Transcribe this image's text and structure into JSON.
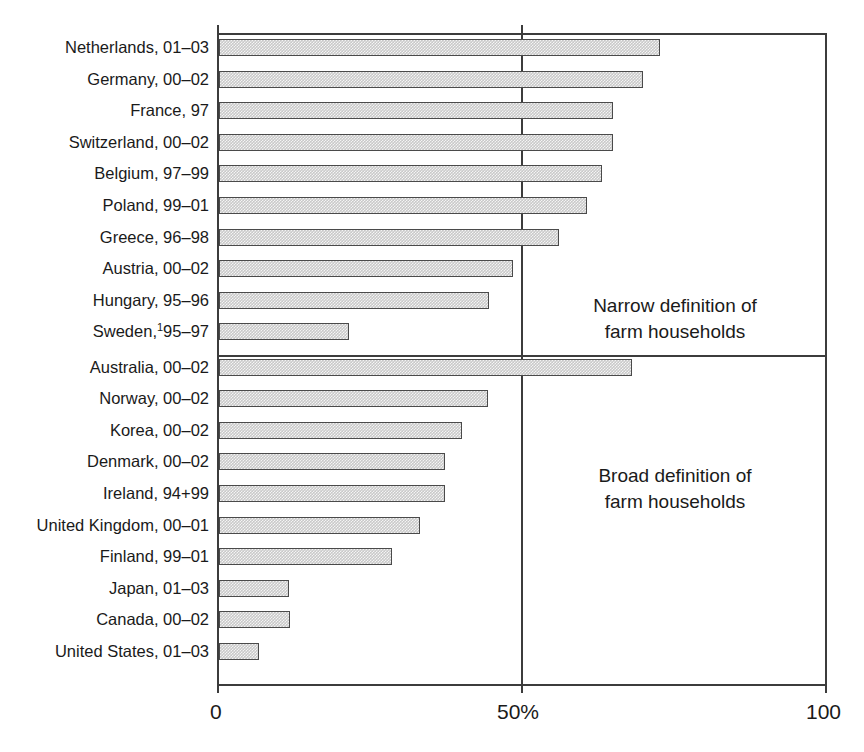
{
  "chart_data": {
    "type": "bar",
    "orientation": "horizontal",
    "title": "",
    "subtitle": "",
    "xlabel": "",
    "ylabel": "",
    "xlim": [
      0,
      100
    ],
    "grid": false,
    "legend_position": "none",
    "axis": {
      "ticks": [
        0,
        50,
        100
      ],
      "tick_labels": [
        "0",
        "50%",
        "100"
      ]
    },
    "annotations": [
      {
        "id": "narrow",
        "text": "Narrow definition of\nfarm households"
      },
      {
        "id": "broad",
        "text": "Broad definition of\nfarm households"
      }
    ],
    "footnote_markers": [
      {
        "category": "Sweden, 95–97",
        "marker": "1"
      }
    ],
    "panels": [
      {
        "name": "Narrow definition of farm households",
        "categories": [
          "Netherlands, 01–03",
          "Germany, 00–02",
          "France, 97",
          "Switzerland, 00–02",
          "Belgium, 97–99",
          "Poland, 99–01",
          "Greece, 96–98",
          "Austria, 00–02",
          "Hungary, 95–96",
          "Sweden, 95–97"
        ],
        "values": [
          72.5,
          69.7,
          64.8,
          64.8,
          63.0,
          60.5,
          56.0,
          48.4,
          44.4,
          21.4
        ]
      },
      {
        "name": "Broad definition of farm households",
        "categories": [
          "Australia, 00–02",
          "Norway, 00–02",
          "Korea, 00–02",
          "Denmark, 00–02",
          "Ireland, 94+99",
          "United Kingdom, 00–01",
          "Finland, 99–01",
          "Japan, 01–03",
          "Canada, 00–02",
          "United States, 01–03"
        ],
        "values": [
          68.0,
          44.2,
          40.0,
          37.2,
          37.2,
          33.0,
          28.5,
          11.5,
          11.7,
          6.6
        ]
      }
    ],
    "categories": [
      "Netherlands, 01–03",
      "Germany, 00–02",
      "France, 97",
      "Switzerland, 00–02",
      "Belgium, 97–99",
      "Poland, 99–01",
      "Greece, 96–98",
      "Austria, 00–02",
      "Hungary, 95–96",
      "Sweden, 95–97",
      "Australia, 00–02",
      "Norway, 00–02",
      "Korea, 00–02",
      "Denmark, 00–02",
      "Ireland, 94+99",
      "United Kingdom, 00–01",
      "Finland, 99–01",
      "Japan, 01–03",
      "Canada, 00–02",
      "United States, 01–03"
    ],
    "values": [
      72.5,
      69.7,
      64.8,
      64.8,
      63.0,
      60.5,
      56.0,
      48.4,
      44.4,
      21.4,
      68.0,
      44.2,
      40.0,
      37.2,
      37.2,
      33.0,
      28.5,
      11.5,
      11.7,
      6.6
    ]
  },
  "colors": {
    "bar_fill": "#c9c9c9",
    "bar_border": "#4a4a4a",
    "axis": "#3c3c3c",
    "text": "#1a1a1a",
    "background": "#ffffff"
  }
}
